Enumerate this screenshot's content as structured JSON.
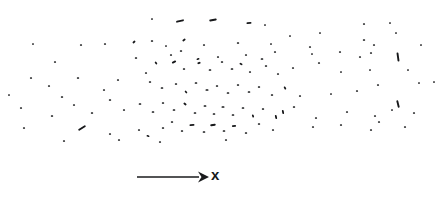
{
  "figure": {
    "title": "",
    "background_color": "#ffffff",
    "mark_color": "#17181a",
    "width": 448,
    "height": 198
  },
  "axis": {
    "label": "x",
    "arrow_direction": "right",
    "arrow_start_x": 137,
    "arrow_end_x": 206,
    "arrow_y": 177,
    "label_color": "#17181a"
  },
  "chart_data": {
    "type": "scatter",
    "title": "",
    "subtitle": "",
    "xlabel": "x",
    "ylabel": "",
    "grid": false,
    "legend": null,
    "axis_ranges": {
      "x": [
        0,
        448
      ],
      "y": [
        0,
        150
      ]
    },
    "marks": [
      {
        "x": 152,
        "y": 19,
        "len": 2.0,
        "ang": 0
      },
      {
        "x": 180,
        "y": 21,
        "len": 8.0,
        "ang": -13
      },
      {
        "x": 213,
        "y": 20,
        "len": 7.5,
        "ang": -11
      },
      {
        "x": 249,
        "y": 23,
        "len": 5.0,
        "ang": -4
      },
      {
        "x": 265,
        "y": 25,
        "len": 2.0,
        "ang": 0
      },
      {
        "x": 364,
        "y": 24,
        "len": 2.2,
        "ang": 0
      },
      {
        "x": 390,
        "y": 23,
        "len": 2.0,
        "ang": 0
      },
      {
        "x": 33,
        "y": 44,
        "len": 2.0,
        "ang": 0
      },
      {
        "x": 81,
        "y": 45,
        "len": 2.2,
        "ang": 0
      },
      {
        "x": 105,
        "y": 44,
        "len": 2.2,
        "ang": 0
      },
      {
        "x": 134,
        "y": 42,
        "len": 3.2,
        "ang": -40
      },
      {
        "x": 152,
        "y": 41,
        "len": 2.4,
        "ang": 0
      },
      {
        "x": 166,
        "y": 46,
        "len": 2.0,
        "ang": 0
      },
      {
        "x": 184,
        "y": 40,
        "len": 3.4,
        "ang": -35
      },
      {
        "x": 204,
        "y": 45,
        "len": 2.2,
        "ang": 0
      },
      {
        "x": 238,
        "y": 43,
        "len": 2.4,
        "ang": 0
      },
      {
        "x": 271,
        "y": 44,
        "len": 2.0,
        "ang": 0
      },
      {
        "x": 310,
        "y": 47,
        "len": 2.2,
        "ang": 0
      },
      {
        "x": 364,
        "y": 40,
        "len": 2.4,
        "ang": 0
      },
      {
        "x": 374,
        "y": 45,
        "len": 2.2,
        "ang": 0
      },
      {
        "x": 396,
        "y": 33,
        "len": 2.0,
        "ang": 0
      },
      {
        "x": 55,
        "y": 62,
        "len": 2.2,
        "ang": 0
      },
      {
        "x": 136,
        "y": 58,
        "len": 2.4,
        "ang": 0
      },
      {
        "x": 171,
        "y": 55,
        "len": 2.2,
        "ang": 0
      },
      {
        "x": 181,
        "y": 51,
        "len": 2.4,
        "ang": 0
      },
      {
        "x": 198,
        "y": 59,
        "len": 3.0,
        "ang": -20
      },
      {
        "x": 218,
        "y": 57,
        "len": 2.2,
        "ang": 0
      },
      {
        "x": 246,
        "y": 55,
        "len": 2.2,
        "ang": 0
      },
      {
        "x": 262,
        "y": 59,
        "len": 2.6,
        "ang": 0
      },
      {
        "x": 275,
        "y": 52,
        "len": 2.2,
        "ang": 0
      },
      {
        "x": 312,
        "y": 54,
        "len": 2.0,
        "ang": 0
      },
      {
        "x": 340,
        "y": 52,
        "len": 2.2,
        "ang": 0
      },
      {
        "x": 360,
        "y": 57,
        "len": 2.2,
        "ang": 0
      },
      {
        "x": 371,
        "y": 53,
        "len": 2.2,
        "ang": 0
      },
      {
        "x": 398,
        "y": 57,
        "len": 9.0,
        "ang": 82
      },
      {
        "x": 31,
        "y": 78,
        "len": 2.2,
        "ang": 0
      },
      {
        "x": 78,
        "y": 78,
        "len": 2.4,
        "ang": 0
      },
      {
        "x": 146,
        "y": 73,
        "len": 2.2,
        "ang": 0
      },
      {
        "x": 156,
        "y": 63,
        "len": 3.0,
        "ang": 55
      },
      {
        "x": 174,
        "y": 62,
        "len": 4.5,
        "ang": -28
      },
      {
        "x": 184,
        "y": 69,
        "len": 2.4,
        "ang": 0
      },
      {
        "x": 199,
        "y": 63,
        "len": 3.2,
        "ang": -18
      },
      {
        "x": 210,
        "y": 70,
        "len": 2.6,
        "ang": 0
      },
      {
        "x": 222,
        "y": 62,
        "len": 2.4,
        "ang": 0
      },
      {
        "x": 232,
        "y": 69,
        "len": 2.6,
        "ang": 0
      },
      {
        "x": 241,
        "y": 64,
        "len": 3.0,
        "ang": 25
      },
      {
        "x": 250,
        "y": 72,
        "len": 2.2,
        "ang": 0
      },
      {
        "x": 266,
        "y": 66,
        "len": 2.4,
        "ang": 0
      },
      {
        "x": 278,
        "y": 74,
        "len": 2.2,
        "ang": 0
      },
      {
        "x": 293,
        "y": 68,
        "len": 2.2,
        "ang": 0
      },
      {
        "x": 319,
        "y": 63,
        "len": 2.2,
        "ang": 0
      },
      {
        "x": 341,
        "y": 72,
        "len": 2.0,
        "ang": 0
      },
      {
        "x": 370,
        "y": 70,
        "len": 2.0,
        "ang": 0
      },
      {
        "x": 408,
        "y": 70,
        "len": 2.0,
        "ang": 0
      },
      {
        "x": 49,
        "y": 86,
        "len": 2.2,
        "ang": 0
      },
      {
        "x": 62,
        "y": 97,
        "len": 2.4,
        "ang": 0
      },
      {
        "x": 104,
        "y": 90,
        "len": 2.2,
        "ang": 0
      },
      {
        "x": 118,
        "y": 80,
        "len": 2.2,
        "ang": 0
      },
      {
        "x": 150,
        "y": 82,
        "len": 2.4,
        "ang": 0
      },
      {
        "x": 162,
        "y": 88,
        "len": 2.6,
        "ang": 0
      },
      {
        "x": 176,
        "y": 84,
        "len": 2.4,
        "ang": 0
      },
      {
        "x": 186,
        "y": 92,
        "len": 3.0,
        "ang": 48
      },
      {
        "x": 196,
        "y": 83,
        "len": 2.6,
        "ang": 0
      },
      {
        "x": 207,
        "y": 90,
        "len": 3.0,
        "ang": 0
      },
      {
        "x": 217,
        "y": 86,
        "len": 2.4,
        "ang": 0
      },
      {
        "x": 228,
        "y": 93,
        "len": 2.6,
        "ang": 0
      },
      {
        "x": 238,
        "y": 85,
        "len": 2.4,
        "ang": 0
      },
      {
        "x": 249,
        "y": 92,
        "len": 2.6,
        "ang": 0
      },
      {
        "x": 259,
        "y": 87,
        "len": 2.4,
        "ang": 0
      },
      {
        "x": 272,
        "y": 95,
        "len": 2.4,
        "ang": 0
      },
      {
        "x": 285,
        "y": 88,
        "len": 3.2,
        "ang": 62
      },
      {
        "x": 300,
        "y": 96,
        "len": 2.2,
        "ang": 0
      },
      {
        "x": 331,
        "y": 94,
        "len": 2.0,
        "ang": 0
      },
      {
        "x": 357,
        "y": 91,
        "len": 2.2,
        "ang": 0
      },
      {
        "x": 378,
        "y": 85,
        "len": 2.2,
        "ang": 0
      },
      {
        "x": 398,
        "y": 104,
        "len": 7.5,
        "ang": 76
      },
      {
        "x": 419,
        "y": 83,
        "len": 2.0,
        "ang": 0
      },
      {
        "x": 21,
        "y": 108,
        "len": 2.2,
        "ang": 0
      },
      {
        "x": 52,
        "y": 116,
        "len": 2.4,
        "ang": 0
      },
      {
        "x": 74,
        "y": 105,
        "len": 2.2,
        "ang": 0
      },
      {
        "x": 92,
        "y": 113,
        "len": 2.4,
        "ang": 0
      },
      {
        "x": 110,
        "y": 100,
        "len": 2.4,
        "ang": 0
      },
      {
        "x": 124,
        "y": 110,
        "len": 2.2,
        "ang": 0
      },
      {
        "x": 140,
        "y": 104,
        "len": 2.6,
        "ang": 0
      },
      {
        "x": 153,
        "y": 112,
        "len": 2.6,
        "ang": 0
      },
      {
        "x": 163,
        "y": 103,
        "len": 2.4,
        "ang": 0
      },
      {
        "x": 174,
        "y": 110,
        "len": 2.6,
        "ang": 0
      },
      {
        "x": 185,
        "y": 104,
        "len": 3.4,
        "ang": 40
      },
      {
        "x": 195,
        "y": 113,
        "len": 2.6,
        "ang": 0
      },
      {
        "x": 205,
        "y": 106,
        "len": 2.8,
        "ang": 0
      },
      {
        "x": 214,
        "y": 114,
        "len": 2.6,
        "ang": 0
      },
      {
        "x": 223,
        "y": 107,
        "len": 3.0,
        "ang": 0
      },
      {
        "x": 233,
        "y": 115,
        "len": 2.6,
        "ang": 0
      },
      {
        "x": 243,
        "y": 108,
        "len": 2.6,
        "ang": 0
      },
      {
        "x": 253,
        "y": 116,
        "len": 3.0,
        "ang": 70
      },
      {
        "x": 263,
        "y": 109,
        "len": 2.4,
        "ang": 0
      },
      {
        "x": 276,
        "y": 117,
        "len": 4.0,
        "ang": 78
      },
      {
        "x": 283,
        "y": 112,
        "len": 4.2,
        "ang": 80
      },
      {
        "x": 294,
        "y": 107,
        "len": 2.4,
        "ang": 0
      },
      {
        "x": 316,
        "y": 118,
        "len": 2.2,
        "ang": 0
      },
      {
        "x": 347,
        "y": 112,
        "len": 2.2,
        "ang": 0
      },
      {
        "x": 375,
        "y": 116,
        "len": 2.2,
        "ang": 0
      },
      {
        "x": 392,
        "y": 110,
        "len": 2.0,
        "ang": 0
      },
      {
        "x": 414,
        "y": 113,
        "len": 2.2,
        "ang": 0
      },
      {
        "x": 434,
        "y": 82,
        "len": 2.0,
        "ang": 0
      },
      {
        "x": 24,
        "y": 128,
        "len": 2.2,
        "ang": 0
      },
      {
        "x": 82,
        "y": 128,
        "len": 8.5,
        "ang": -32
      },
      {
        "x": 110,
        "y": 134,
        "len": 2.2,
        "ang": 0
      },
      {
        "x": 139,
        "y": 130,
        "len": 2.2,
        "ang": 0
      },
      {
        "x": 148,
        "y": 136,
        "len": 3.0,
        "ang": 20
      },
      {
        "x": 163,
        "y": 128,
        "len": 2.4,
        "ang": 0
      },
      {
        "x": 172,
        "y": 122,
        "len": 2.4,
        "ang": 0
      },
      {
        "x": 182,
        "y": 131,
        "len": 2.4,
        "ang": 0
      },
      {
        "x": 192,
        "y": 125,
        "len": 5.0,
        "ang": -6
      },
      {
        "x": 204,
        "y": 132,
        "len": 2.6,
        "ang": 0
      },
      {
        "x": 213,
        "y": 125,
        "len": 5.5,
        "ang": -8
      },
      {
        "x": 224,
        "y": 131,
        "len": 2.6,
        "ang": 0
      },
      {
        "x": 234,
        "y": 126,
        "len": 4.2,
        "ang": -10
      },
      {
        "x": 246,
        "y": 133,
        "len": 2.4,
        "ang": 0
      },
      {
        "x": 259,
        "y": 124,
        "len": 2.4,
        "ang": 0
      },
      {
        "x": 273,
        "y": 130,
        "len": 2.2,
        "ang": 0
      },
      {
        "x": 313,
        "y": 127,
        "len": 2.2,
        "ang": 0
      },
      {
        "x": 341,
        "y": 125,
        "len": 2.2,
        "ang": 0
      },
      {
        "x": 371,
        "y": 130,
        "len": 2.2,
        "ang": 0
      },
      {
        "x": 379,
        "y": 122,
        "len": 2.2,
        "ang": 0
      },
      {
        "x": 405,
        "y": 127,
        "len": 2.2,
        "ang": 0
      },
      {
        "x": 64,
        "y": 141,
        "len": 2.2,
        "ang": 0
      },
      {
        "x": 119,
        "y": 140,
        "len": 2.2,
        "ang": 0
      },
      {
        "x": 160,
        "y": 142,
        "len": 2.2,
        "ang": 0
      },
      {
        "x": 226,
        "y": 140,
        "len": 2.2,
        "ang": 0
      },
      {
        "x": 290,
        "y": 36,
        "len": 2.0,
        "ang": 0
      },
      {
        "x": 320,
        "y": 33,
        "len": 2.0,
        "ang": 0
      },
      {
        "x": 421,
        "y": 45,
        "len": 2.0,
        "ang": 0
      },
      {
        "x": 9,
        "y": 95,
        "len": 2.0,
        "ang": 0
      }
    ]
  }
}
